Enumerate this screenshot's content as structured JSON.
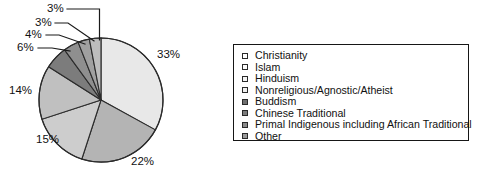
{
  "chart_data": {
    "type": "pie",
    "title": "",
    "categories": [
      "Christianity",
      "Islam",
      "Hinduism",
      "Nonreligious/Agnostic/Atheist",
      "Buddism",
      "Chinese Traditional",
      "Primal Indigenous including African Traditional",
      "Other"
    ],
    "values": [
      33,
      22,
      15,
      14,
      6,
      4,
      3,
      3
    ],
    "value_labels": [
      "33%",
      "22%",
      "15%",
      "14%",
      "6%",
      "4%",
      "3%",
      "3%"
    ],
    "unit": "%",
    "legend_position": "right",
    "grid": false,
    "start_angle_deg": 0,
    "direction": "clockwise",
    "slice_colors": [
      "#e8e8e8",
      "#b4b4b4",
      "#cdcdcd",
      "#c0c0c0",
      "#7c7c7c",
      "#8f8f8f",
      "#a0a0a0",
      "#bdbdbd"
    ],
    "slice_border_color": "#2b2b2b",
    "leader_line_color": "#1a1a1a"
  },
  "legend": {
    "items": [
      {
        "label": "Christianity",
        "swatch": "#ffffff"
      },
      {
        "label": "Islam",
        "swatch": "#fbfbfb"
      },
      {
        "label": "Hinduism",
        "swatch": "#f4f4f4"
      },
      {
        "label": "Nonreligious/Agnostic/Atheist",
        "swatch": "#efefef"
      },
      {
        "label": "Buddism",
        "swatch": "#6f6f6f"
      },
      {
        "label": "Chinese Traditional",
        "swatch": "#7d7d7d"
      },
      {
        "label": "Primal Indigenous including African Traditional",
        "swatch": "#8b8b8b"
      },
      {
        "label": "Other",
        "swatch": "#9a9a9a"
      }
    ]
  },
  "labels": {
    "p33": "33%",
    "p22": "22%",
    "p15": "15%",
    "p14": "14%",
    "p6": "6%",
    "p4": "4%",
    "p3a": "3%",
    "p3b": "3%"
  }
}
